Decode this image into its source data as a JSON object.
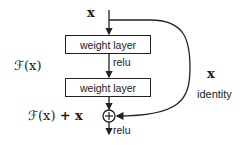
{
  "diagram": {
    "input_label": "x",
    "layers": [
      {
        "label": "weight layer"
      },
      {
        "label": "weight layer"
      }
    ],
    "activation_1": "relu",
    "activation_2": "relu",
    "residual_function_label": "ℱ(x)",
    "sum_label_f": "ℱ(x)",
    "sum_label_plus": "+ x",
    "add_symbol": "⊕",
    "shortcut_label_x": "x",
    "shortcut_label": "identity",
    "line_color": "#222222"
  }
}
